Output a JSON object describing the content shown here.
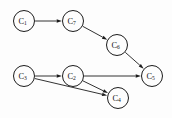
{
  "diagram": {
    "type": "directed-graph",
    "width": 172,
    "height": 118,
    "background_color": "#fdfdfd",
    "stroke_color": "#1c1c1c",
    "label_color": "#111111",
    "nodes": [
      {
        "id": "C1",
        "base": "C",
        "subscript": "1",
        "label": "C1",
        "x": 24,
        "y": 21,
        "r": 10.5
      },
      {
        "id": "C7",
        "base": "C",
        "subscript": "7",
        "label": "C7",
        "x": 73,
        "y": 21,
        "r": 10.5
      },
      {
        "id": "C6",
        "base": "C",
        "subscript": "6",
        "label": "C6",
        "x": 117,
        "y": 45,
        "r": 10.5
      },
      {
        "id": "C3",
        "base": "C",
        "subscript": "3",
        "label": "C3",
        "x": 24,
        "y": 76,
        "r": 10.5
      },
      {
        "id": "C2",
        "base": "C",
        "subscript": "2",
        "label": "C2",
        "x": 73,
        "y": 76,
        "r": 10.5
      },
      {
        "id": "C5",
        "base": "C",
        "subscript": "5",
        "label": "C5",
        "x": 152,
        "y": 76,
        "r": 10.5
      },
      {
        "id": "C4",
        "base": "C",
        "subscript": "4",
        "label": "C4",
        "x": 118,
        "y": 98,
        "r": 10.5
      }
    ],
    "edges": [
      {
        "id": "e1",
        "from": "C1",
        "to": "C7",
        "directed": true
      },
      {
        "id": "e2",
        "from": "C7",
        "to": "C6",
        "directed": true
      },
      {
        "id": "e3",
        "from": "C6",
        "to": "C5",
        "directed": true
      },
      {
        "id": "e4",
        "from": "C3",
        "to": "C2",
        "directed": true
      },
      {
        "id": "e5",
        "from": "C3",
        "to": "C4",
        "directed": true
      },
      {
        "id": "e6",
        "from": "C2",
        "to": "C4",
        "directed": true
      },
      {
        "id": "e7",
        "from": "C2",
        "to": "C5",
        "directed": true
      }
    ]
  }
}
